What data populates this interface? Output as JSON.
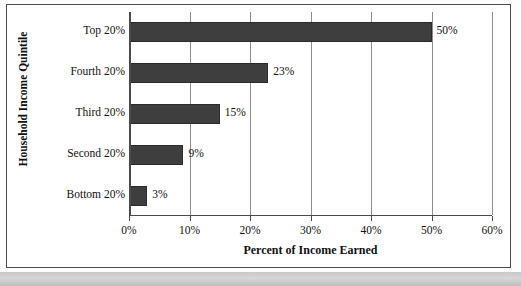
{
  "chart_data": {
    "type": "bar",
    "orientation": "horizontal",
    "title": "",
    "xlabel": "Percent of Income Earned",
    "ylabel": "Household Income Quintile",
    "categories": [
      "Top 20%",
      "Fourth 20%",
      "Third 20%",
      "Second 20%",
      "Bottom 20%"
    ],
    "values": [
      50,
      23,
      15,
      9,
      3
    ],
    "value_labels": [
      "50%",
      "23%",
      "15%",
      "9%",
      "3%"
    ],
    "xlim": [
      0,
      60
    ],
    "xticks": [
      0,
      10,
      20,
      30,
      40,
      50,
      60
    ],
    "xtick_labels": [
      "0%",
      "10%",
      "20%",
      "30%",
      "40%",
      "50%",
      "60%"
    ],
    "grid": "vertical",
    "legend": "none",
    "bar_color": "#3e3e3e",
    "axis_color": "#4a4a4a",
    "gridline_color": "#8d8d8d"
  }
}
